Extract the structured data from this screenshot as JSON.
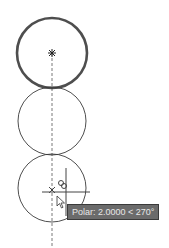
{
  "drawing": {
    "circles": [
      {
        "name": "selected-circle",
        "cx": 52,
        "cy": 53,
        "r": 35,
        "highlighted": true
      },
      {
        "name": "middle-circle",
        "cx": 52,
        "cy": 121,
        "r": 34,
        "highlighted": false
      },
      {
        "name": "new-circle-preview",
        "cx": 52,
        "cy": 188,
        "r": 34,
        "highlighted": false
      }
    ],
    "center_marker": {
      "x": 52,
      "y": 53
    },
    "polar_tracking_line": {
      "x": 52,
      "y1": 53,
      "y2": 248
    },
    "cursor": {
      "x": 66,
      "y": 192,
      "size": 24
    },
    "colors": {
      "line": "#3a3a3a",
      "highlight": "#2f2f2f",
      "tooltip_bg": "#6b6b6b"
    }
  },
  "tooltip": {
    "text": "Polar: 2.0000 < 270°"
  }
}
